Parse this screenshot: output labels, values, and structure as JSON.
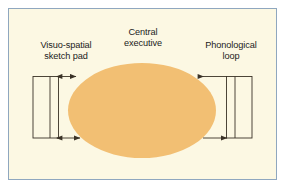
{
  "figure": {
    "frame_color": "#8fa7bf",
    "background_color": "#fcf8e3",
    "page_background": "#ffffff",
    "line_color": "#3a3226",
    "text_color": "#1b1b1b"
  },
  "components": {
    "central": {
      "label": "Central\nexecutive",
      "shape": "ellipse",
      "fill_color": "#f2bf73"
    },
    "left": {
      "label": "Visuo-spatial\nsketch pad",
      "shape": "rectangle-with-divider"
    },
    "right": {
      "label": "Phonological\nloop",
      "shape": "rectangle-with-divider"
    }
  },
  "connectors": [
    {
      "name": "left-top-connector",
      "direction": "bidirectional"
    },
    {
      "name": "left-bottom-connector",
      "direction": "bidirectional"
    },
    {
      "name": "right-top-connector",
      "direction": "left"
    },
    {
      "name": "right-bottom-connector",
      "direction": "right"
    }
  ]
}
